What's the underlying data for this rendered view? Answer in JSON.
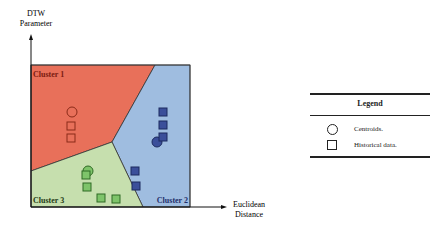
{
  "chart_data": {
    "type": "scatter",
    "title": "",
    "xlabel": "Euclidean Distance",
    "ylabel": "DTW Parameter",
    "grid": false,
    "legend_position": "right",
    "regions": [
      {
        "name": "Cluster 1",
        "color": "#e8705a"
      },
      {
        "name": "Cluster 2",
        "color": "#9fbde0"
      },
      {
        "name": "Cluster 3",
        "color": "#c6dfae"
      }
    ],
    "series": [
      {
        "name": "Cluster 1 centroid",
        "marker": "circle",
        "color": "#e8705a",
        "points": [
          [
            72,
            112
          ]
        ]
      },
      {
        "name": "Cluster 1 historical data",
        "marker": "square",
        "color": "#e8705a",
        "points": [
          [
            71,
            126
          ],
          [
            71,
            138
          ]
        ]
      },
      {
        "name": "Cluster 2 centroid",
        "marker": "circle",
        "color": "#3b4f9a",
        "points": [
          [
            157,
            142
          ]
        ]
      },
      {
        "name": "Cluster 2 historical data",
        "marker": "square",
        "color": "#3b4f9a",
        "points": [
          [
            163,
            112
          ],
          [
            163,
            125
          ],
          [
            163,
            137
          ],
          [
            135,
            171
          ],
          [
            136,
            186
          ]
        ]
      },
      {
        "name": "Cluster 3 centroid",
        "marker": "circle",
        "color": "#7ec46a",
        "points": [
          [
            88,
            171
          ]
        ]
      },
      {
        "name": "Cluster 3 historical data",
        "marker": "square",
        "color": "#7ec46a",
        "points": [
          [
            86,
            175
          ],
          [
            87,
            187
          ],
          [
            101,
            198
          ],
          [
            116,
            199
          ]
        ]
      }
    ]
  },
  "figure": {
    "y_axis_label_line1": "DTW",
    "y_axis_label_line2": "Parameter",
    "x_axis_label_line1": "Euclidean",
    "x_axis_label_line2": "Distance",
    "cluster_labels": [
      "Cluster 1",
      "Cluster 2",
      "Cluster 3"
    ]
  },
  "legend": {
    "title": "Legend",
    "items": [
      {
        "symbol": "circle",
        "label": "Centroids."
      },
      {
        "symbol": "square",
        "label": "Historical data."
      }
    ]
  }
}
